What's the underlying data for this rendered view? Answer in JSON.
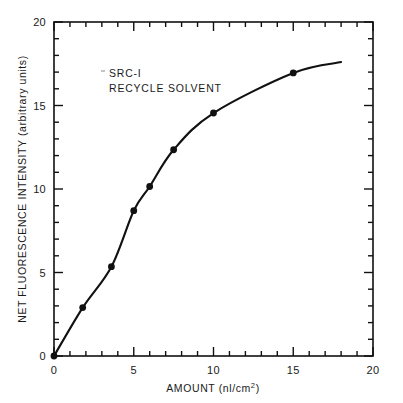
{
  "chart_data": {
    "type": "line",
    "title": "",
    "subtitle": "",
    "xlabel": "AMOUNT (nl/cm2)",
    "xlabel_main": "AMOUNT (nl/cm",
    "xlabel_sup": "2",
    "xlabel_tail": ")",
    "ylabel": "NET FLUORESCENCE INTENSITY (arbitrary units)",
    "xlim": [
      0,
      20
    ],
    "ylim": [
      0,
      20
    ],
    "x_ticks_major": [
      0,
      5,
      10,
      15,
      20
    ],
    "x_tick_labels": [
      "0",
      "5",
      "10",
      "15",
      "20"
    ],
    "y_ticks_major": [
      0,
      5,
      10,
      15,
      20
    ],
    "y_tick_labels": [
      "0",
      "5",
      "10",
      "15",
      "20"
    ],
    "x_minor_interval": 1,
    "y_minor_interval": 1,
    "grid": false,
    "legend": "none",
    "annotations": [
      {
        "line1": "SRC-I",
        "line2": "RECYCLE SOLVENT",
        "x": 3.5,
        "y": 17.0
      }
    ],
    "series": [
      {
        "name": "SRC-I recycle solvent",
        "marker": "filled-circle",
        "marker_color": "#111111",
        "line_color": "#111111",
        "x": [
          0,
          1.8,
          3.6,
          5.0,
          6.0,
          7.5,
          10.0,
          15.0
        ],
        "y": [
          0,
          2.9,
          5.35,
          8.7,
          10.15,
          12.35,
          14.55,
          16.95
        ],
        "points": [
          {
            "x": 0,
            "y": 0
          },
          {
            "x": 1.8,
            "y": 2.9
          },
          {
            "x": 3.6,
            "y": 5.35
          },
          {
            "x": 5.0,
            "y": 8.7
          },
          {
            "x": 6.0,
            "y": 10.15
          },
          {
            "x": 7.5,
            "y": 12.35
          },
          {
            "x": 10.0,
            "y": 14.55
          },
          {
            "x": 15.0,
            "y": 16.95
          }
        ],
        "curve_extends_to_x": 18.0,
        "curve_extends_to_y": 17.6
      }
    ]
  },
  "colors": {
    "ink": "#111111",
    "background": "#ffffff"
  }
}
